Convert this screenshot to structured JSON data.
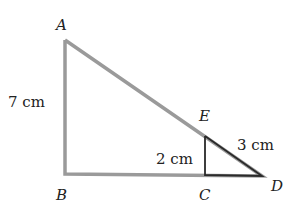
{
  "diagram": {
    "points": {
      "A": {
        "label": "A",
        "x": 65,
        "y": 40
      },
      "B": {
        "label": "B",
        "x": 65,
        "y": 174
      },
      "C": {
        "label": "C",
        "x": 205,
        "y": 175
      },
      "D": {
        "label": "D",
        "x": 262,
        "y": 176
      },
      "E": {
        "label": "E",
        "x": 205,
        "y": 136
      }
    },
    "measurements": {
      "AB": "7 cm",
      "CE": "2 cm",
      "ED": "3 cm"
    },
    "colors": {
      "large_triangle": "#9a9a9a",
      "small_triangle": "#2a2a2a"
    }
  }
}
